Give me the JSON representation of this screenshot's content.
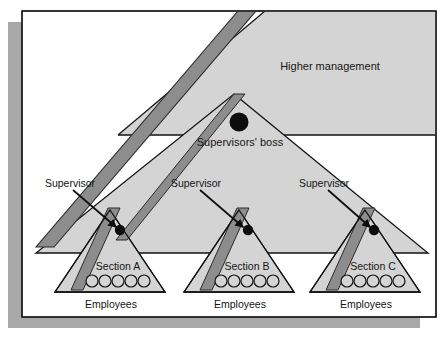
{
  "figure": {
    "type": "diagram",
    "subtype": "organizational-hierarchy-triangles",
    "palette": {
      "page_background": "#ffffff",
      "panel_fill": "#ffffff",
      "panel_border": "#1a1a1a",
      "drop_shadow": "#a8a8a8",
      "triangle_fill": "#d4d4d4",
      "triangle_stroke": "#111111",
      "band_fill": "#8d8d8d",
      "band_stroke": "#2a2a2a",
      "dot_fill": "#0d0d0d",
      "circle_fill": "#d4d4d4",
      "circle_stroke": "#111111",
      "text_color": "#141414"
    },
    "labels": {
      "higher_management": "Higher management",
      "supervisors_boss": "Supervisors' boss",
      "supervisor_left": "Supervisor",
      "supervisor_middle": "Supervisor",
      "supervisor_right": "Supervisor"
    },
    "sections": [
      {
        "name": "Section A",
        "employees_label": "Employees",
        "employee_count": 5
      },
      {
        "name": "Section B",
        "employees_label": "Employees",
        "employee_count": 5
      },
      {
        "name": "Section C",
        "employees_label": "Employees",
        "employee_count": 5
      }
    ],
    "nodes": {
      "boss_dot_count": 1,
      "supervisor_dot_count": 3
    }
  }
}
